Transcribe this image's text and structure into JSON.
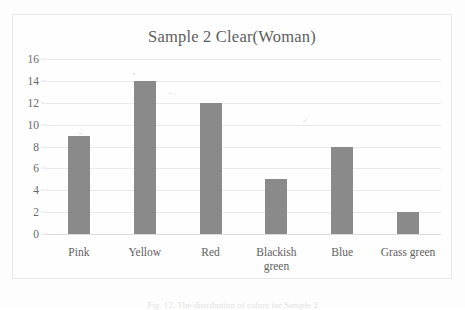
{
  "chart_data": {
    "type": "bar",
    "title": "Sample 2 Clear(Woman)",
    "categories": [
      "Pink",
      "Yellow",
      "Red",
      "Blackish green",
      "Blue",
      "Grass green"
    ],
    "values": [
      9,
      14,
      12,
      5,
      8,
      2
    ],
    "xlabel": "",
    "ylabel": "",
    "ylim": [
      0,
      16
    ],
    "ytick_step": 2,
    "yticks": [
      "16",
      "14",
      "12",
      "10",
      "8",
      "6",
      "4",
      "2",
      "0"
    ],
    "grid": true,
    "legend": false,
    "bar_color": "#8a8a8a",
    "gridline_color": "#e9e9e9",
    "text_color": "#5d5d5d"
  },
  "figure": {
    "caption": "Fig. 12. The distribution of colors for Sample 2"
  }
}
